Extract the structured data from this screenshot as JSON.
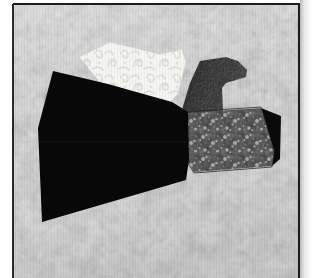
{
  "artwork": {
    "title": "Paper-Pieced Bird Quilt Block",
    "subject": "bird",
    "medium": "quilt block diagram",
    "canvas": {
      "width": 320,
      "height": 278
    },
    "palette": {
      "page_background": "#ffffff",
      "border_frame": "#1c1c1c",
      "block_background_base": "#d2d2d2",
      "block_background_light": "#ececec",
      "block_background_shadow": "#b4b4b4",
      "wing_black": "#080808",
      "upper_wing_white": "#f4f4f0",
      "upper_wing_pattern": "#dcdcd6",
      "head_dark": "#282828",
      "head_highlight": "#4a4a4a",
      "tail_floral_base": "#3a3a3a",
      "tail_floral_speck": "#9a9a9a",
      "tail_black_wedge": "#0a0a0a"
    },
    "frame": {
      "left": 13,
      "top": 4,
      "right": 299,
      "bottom": 278,
      "stroke_width": 2
    },
    "pieces": [
      {
        "name": "block-background",
        "label": "Background",
        "fabric": "light gray mottled marble",
        "fill": "#d9d9d9",
        "points": "14,5 298,5 298,277 14,277"
      },
      {
        "name": "upper-wing-white",
        "label": "Upper Wing",
        "fabric": "cream scroll print",
        "fill": "#f4f4f0",
        "points": "79,57 110,42 160,54 182,49 186,62 178,94 166,106 104,88"
      },
      {
        "name": "wing-black",
        "label": "Main Wing",
        "fabric": "solid black",
        "fill": "#080808",
        "points": "53,71 108,84 172,102 188,112 189,160 186,180 42,222 38,128"
      },
      {
        "name": "head-dark",
        "label": "Head and Beak",
        "fabric": "dark mottled print",
        "fill": "#282828",
        "points": "200,61 226,57 238,61 247,70 246,77 226,83 222,88 223,112 218,124 196,126 181,113 190,83"
      },
      {
        "name": "tail-floral",
        "label": "Tail",
        "fabric": "dark floral print",
        "fill": "#3a3a3a",
        "points": "186,113 261,108 274,151 272,166 194,172 182,152"
      },
      {
        "name": "tail-black-wedge",
        "label": "Tail Tip",
        "fabric": "solid black",
        "fill": "#0a0a0a",
        "points": "261,108 281,116 280,159 272,166 274,151"
      }
    ],
    "seam_lines": [
      {
        "name": "wing-center-seam",
        "x1": 39,
        "y1": 142,
        "x2": 188,
        "y2": 142
      },
      {
        "name": "background-horizon-seam",
        "x1": 14,
        "y1": 142,
        "x2": 298,
        "y2": 142
      }
    ]
  }
}
